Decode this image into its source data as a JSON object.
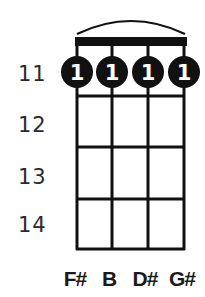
{
  "chord": {
    "strings": [
      "F#",
      "B",
      "D#",
      "G#"
    ],
    "fret_numbers": [
      "11",
      "12",
      "13",
      "14"
    ],
    "barre": true,
    "fingers": [
      {
        "string": 1,
        "fret": 11,
        "finger": "1"
      },
      {
        "string": 2,
        "fret": 11,
        "finger": "1"
      },
      {
        "string": 3,
        "fret": 11,
        "finger": "1"
      },
      {
        "string": 4,
        "fret": 11,
        "finger": "1"
      }
    ]
  },
  "colors": {
    "ink": "#111111",
    "dot_fill": "#111111",
    "dot_text": "#ffffff",
    "fret_number": "#2a2a2a"
  }
}
